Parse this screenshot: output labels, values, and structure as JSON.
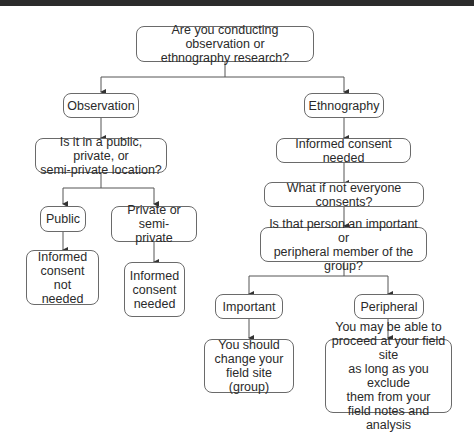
{
  "nodes": {
    "root": "Are you conducting observation or\nethnography research?",
    "observation": "Observation",
    "location_question": "Is it in a public, private, or\nsemi-private location?",
    "public": "Public",
    "private": "Private or semi-\nprivate",
    "consent_not_needed": "Informed\nconsent not\nneeded",
    "consent_needed_private": "Informed\nconsent\nneeded",
    "ethnography": "Ethnography",
    "consent_needed": "Informed consent needed",
    "not_everyone": "What if not everyone consents?",
    "member_question": "Is that person an important or\nperipheral member of the group?",
    "important": "Important",
    "peripheral": "Peripheral",
    "change_site": "You should\nchange your\nfield site (group)",
    "proceed": "You may be able to\nproceed at your field site\nas long as you exclude\nthem from your\nfield notes and analysis"
  }
}
